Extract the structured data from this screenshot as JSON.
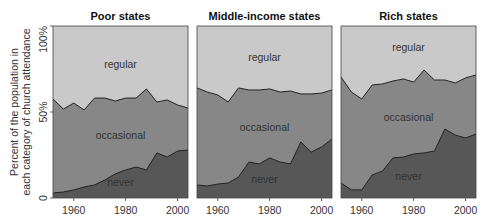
{
  "chart_data": {
    "type": "area",
    "stacked": true,
    "ylabel": "Percent of the population in each category of church attendance",
    "ylabel_lines": [
      "Percent of the population in",
      "each category of church attendance"
    ],
    "yticks": [
      "0",
      "50%",
      "100%"
    ],
    "ylim": [
      0,
      100
    ],
    "xticks": [
      1960,
      1980,
      2000
    ],
    "xlim": [
      1952,
      2004
    ],
    "x": [
      1952,
      1956,
      1960,
      1964,
      1968,
      1972,
      1976,
      1980,
      1984,
      1988,
      1992,
      1996,
      2000,
      2004
    ],
    "series_names": [
      "never",
      "occasional",
      "regular"
    ],
    "colors": {
      "never": "#575757",
      "occasional": "#878787",
      "regular": "#c9c9c9",
      "line": "#222222"
    },
    "panels": [
      {
        "title": "Poor states",
        "never": [
          2.9,
          3.5,
          4.7,
          6.4,
          7.6,
          10.5,
          14.0,
          16.3,
          18.0,
          16.3,
          26.2,
          23.8,
          27.3,
          27.9
        ],
        "never_plus_occasional": [
          57.6,
          51.7,
          55.2,
          51.2,
          58.1,
          58.1,
          56.4,
          58.1,
          58.1,
          63.4,
          55.8,
          57.0,
          54.1,
          52.3
        ],
        "labels": {
          "regular": "regular",
          "occasional": "occasional",
          "never": "never"
        }
      },
      {
        "title": "Middle-income states",
        "never": [
          7.6,
          7.0,
          8.1,
          8.7,
          12.2,
          20.9,
          19.8,
          23.3,
          20.9,
          19.8,
          32.6,
          26.7,
          29.7,
          34.3
        ],
        "never_plus_occasional": [
          64.0,
          61.6,
          59.9,
          55.8,
          64.0,
          62.8,
          62.8,
          63.4,
          61.6,
          62.2,
          60.5,
          60.5,
          61.0,
          62.8
        ],
        "labels": {
          "regular": "regular",
          "occasional": "occasional",
          "never": "never"
        }
      },
      {
        "title": "Rich states",
        "never": [
          8.7,
          4.7,
          4.7,
          13.4,
          15.7,
          23.3,
          23.8,
          25.6,
          26.2,
          27.3,
          40.1,
          36.6,
          34.9,
          37.2
        ],
        "never_plus_occasional": [
          70.3,
          61.6,
          57.6,
          65.7,
          66.3,
          68.0,
          69.2,
          67.4,
          74.4,
          68.6,
          68.6,
          66.9,
          69.8,
          71.5
        ],
        "labels": {
          "regular": "regular",
          "occasional": "occasional",
          "never": "never"
        }
      }
    ],
    "grid": false,
    "legend": "inline area labels"
  }
}
